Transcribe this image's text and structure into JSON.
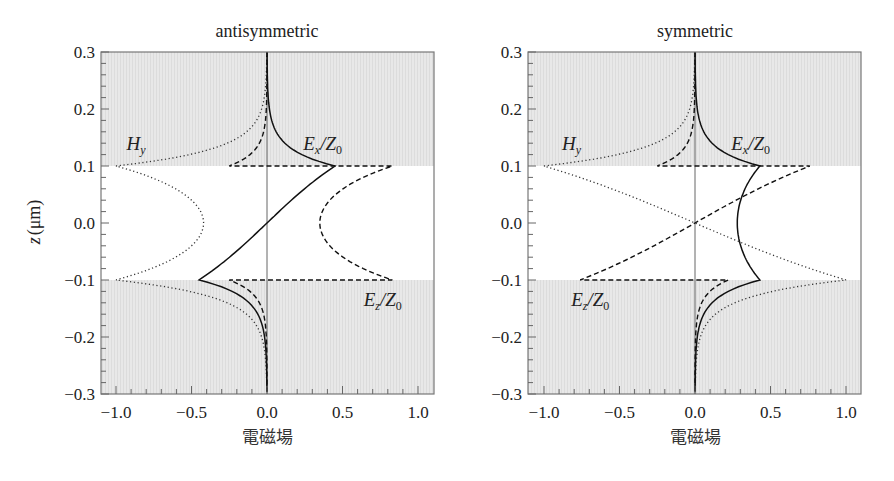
{
  "chart_data": [
    {
      "type": "line",
      "title": "antisymmetric",
      "xlabel": "電磁場",
      "ylabel": "z (μm)",
      "xlim": [
        -1.1,
        1.1
      ],
      "ylim": [
        -0.3,
        0.3
      ],
      "xticks": [
        "−1.0",
        "−0.5",
        "0.0",
        "0.5",
        "1.0"
      ],
      "xtick_values": [
        -1.0,
        -0.5,
        0.0,
        0.5,
        1.0
      ],
      "yticks": [
        "0.3",
        "0.2",
        "0.1",
        "0.0",
        "−0.1",
        "−0.2",
        "−0.3"
      ],
      "ytick_values": [
        0.3,
        0.2,
        0.1,
        0.0,
        -0.1,
        -0.2,
        -0.3
      ],
      "shaded_regions": [
        [
          0.1,
          0.3
        ],
        [
          -0.3,
          -0.1
        ]
      ],
      "grid": false,
      "series": [
        {
          "name": "H_y",
          "style": "dotted",
          "core": "cosh",
          "core_at_edge": -1.0,
          "core_at_center": -0.42,
          "top_edge": -1.0,
          "bottom_edge": -1.0,
          "decay_length": 0.03
        },
        {
          "name": "E_x/Z_0",
          "style": "solid",
          "core": "sinh",
          "core_at_edge": 0.45,
          "top_edge": 0.45,
          "bottom_edge": -0.45,
          "decay_length": 0.03
        },
        {
          "name": "E_z/Z_0",
          "style": "dashed",
          "core": "cosh",
          "core_at_edge": 0.83,
          "core_at_center": 0.35,
          "top_edge": -0.25,
          "bottom_edge": -0.25,
          "decay_length": 0.025
        }
      ],
      "labels": [
        {
          "text": "H",
          "sub": "y",
          "x": -0.93,
          "z": 0.138
        },
        {
          "text": "E",
          "sub": "x",
          "text2": "/Z",
          "sub2": "0",
          "x": 0.24,
          "z": 0.138
        },
        {
          "text": "E",
          "sub": "z",
          "text2": "/Z",
          "sub2": "0",
          "x": 0.64,
          "z": -0.135
        }
      ]
    },
    {
      "type": "line",
      "title": "symmetric",
      "xlabel": "電磁場",
      "ylabel": "z (μm)",
      "xlim": [
        -1.1,
        1.1
      ],
      "ylim": [
        -0.3,
        0.3
      ],
      "xticks": [
        "−1.0",
        "−0.5",
        "0.0",
        "0.5",
        "1.0"
      ],
      "xtick_values": [
        -1.0,
        -0.5,
        0.0,
        0.5,
        1.0
      ],
      "yticks": [
        "0.3",
        "0.2",
        "0.1",
        "0.0",
        "−0.1",
        "−0.2",
        "−0.3"
      ],
      "ytick_values": [
        0.3,
        0.2,
        0.1,
        0.0,
        -0.1,
        -0.2,
        -0.3
      ],
      "shaded_regions": [
        [
          0.1,
          0.3
        ],
        [
          -0.3,
          -0.1
        ]
      ],
      "grid": false,
      "series": [
        {
          "name": "H_y",
          "style": "dotted",
          "core": "sinh",
          "core_at_edge": -1.0,
          "top_edge": -1.0,
          "bottom_edge": 1.0,
          "decay_length": 0.03
        },
        {
          "name": "E_x/Z_0",
          "style": "solid",
          "core": "cosh",
          "core_at_edge": 0.43,
          "core_at_center": 0.28,
          "top_edge": 0.43,
          "bottom_edge": 0.43,
          "decay_length": 0.03
        },
        {
          "name": "E_z/Z_0",
          "style": "dashed",
          "core": "sinh",
          "core_at_edge": 0.76,
          "top_edge": -0.25,
          "bottom_edge": 0.22,
          "decay_length": 0.025
        }
      ],
      "labels": [
        {
          "text": "H",
          "sub": "y",
          "x": -0.88,
          "z": 0.138
        },
        {
          "text": "E",
          "sub": "x",
          "text2": "/Z",
          "sub2": "0",
          "x": 0.24,
          "z": 0.138
        },
        {
          "text": "E",
          "sub": "z",
          "text2": "/Z",
          "sub2": "0",
          "x": -0.82,
          "z": -0.135
        }
      ]
    }
  ],
  "panels": [
    {
      "title": "antisymmetric",
      "xlabel": "電磁場",
      "ylabel_main": "z",
      "ylabel_unit": "(μm)"
    },
    {
      "title": "symmetric",
      "xlabel": "電磁場"
    }
  ]
}
